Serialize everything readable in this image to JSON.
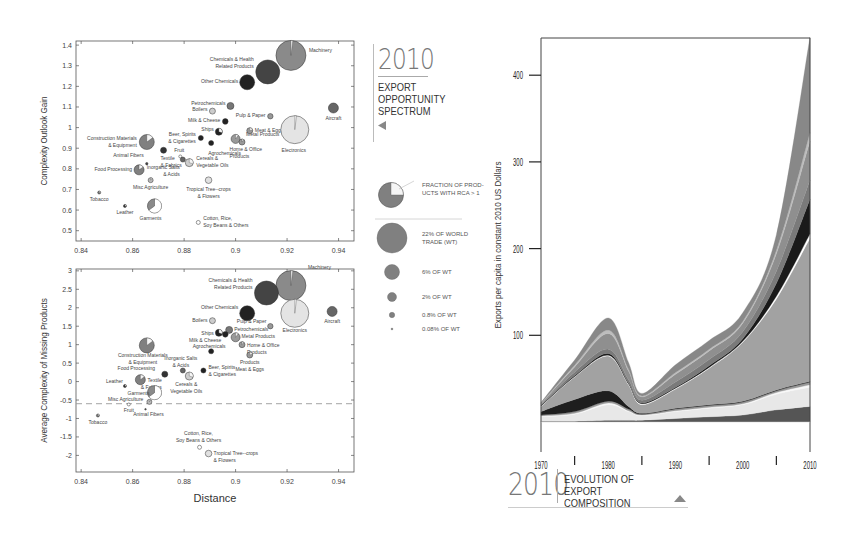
{
  "chart_data": [
    {
      "type": "scatter",
      "title": "Export Opportunity Spectrum (2010) - Complexity Outlook Gain",
      "xlabel": "",
      "ylabel": "Complexity Outlook Gain",
      "xlim": [
        0.838,
        0.946
      ],
      "ylim": [
        0.45,
        1.42
      ],
      "xticks": [
        "0.84",
        "0.86",
        "0.88",
        "0.9",
        "0.92",
        "0.94"
      ],
      "yticks": [
        "1.4",
        "1.3",
        "1.2",
        "1.1",
        "1",
        "0.9",
        "0.8",
        "0.7",
        "0.6",
        "0.5"
      ],
      "grid": false,
      "points": [
        {
          "label": "Machinery",
          "x": 0.9215,
          "y": 1.35,
          "r": 15,
          "color": "#8a8a8a",
          "rca": 0.02,
          "label_dx": 18,
          "label_dy": -3
        },
        {
          "label": "Chemicals & Health Related Products",
          "x": 0.9125,
          "y": 1.27,
          "r": 12,
          "color": "#444444",
          "rca": 0,
          "label_dx": -14,
          "label_dy": -11,
          "anchor": "end"
        },
        {
          "label": "Other Chemicals",
          "x": 0.9045,
          "y": 1.22,
          "r": 7.5,
          "color": "#222222",
          "rca": 0,
          "label_dx": -9,
          "label_dy": 1,
          "anchor": "end"
        },
        {
          "label": "Petrochemicals",
          "x": 0.898,
          "y": 1.105,
          "r": 3.5,
          "color": "#777777",
          "rca": 0,
          "label_dx": -5,
          "label_dy": -1,
          "anchor": "end"
        },
        {
          "label": "Boilers",
          "x": 0.891,
          "y": 1.08,
          "r": 3,
          "color": "#cccccc",
          "rca": 0,
          "label_dx": -5,
          "label_dy": 0,
          "anchor": "end"
        },
        {
          "label": "Milk & Cheese",
          "x": 0.896,
          "y": 1.03,
          "r": 2.8,
          "color": "#222222",
          "rca": 0,
          "label_dx": -5,
          "label_dy": 1,
          "anchor": "end"
        },
        {
          "label": "Ships",
          "x": 0.8935,
          "y": 0.98,
          "r": 3.5,
          "color": "#222222",
          "rca": 0.3,
          "label_dx": -5,
          "label_dy": -1,
          "anchor": "end"
        },
        {
          "label": "Beer, Spirits & Cigarettes",
          "x": 0.8865,
          "y": 0.95,
          "r": 2.5,
          "color": "#222222",
          "rca": 0,
          "label_dx": -5,
          "label_dy": -2,
          "anchor": "end"
        },
        {
          "label": "Agrochemicals",
          "x": 0.8905,
          "y": 0.925,
          "r": 2.5,
          "color": "#222222",
          "rca": 0,
          "label_dx": -3,
          "label_dy": 12,
          "anchor": "start"
        },
        {
          "label": "Home & Office Products",
          "x": 0.9,
          "y": 0.945,
          "r": 4.5,
          "color": "#999999",
          "rca": 0.1,
          "label_dx": -6,
          "label_dy": 12,
          "anchor": "start"
        },
        {
          "label": "Metal Products",
          "x": 0.9025,
          "y": 0.93,
          "r": 3,
          "color": "#999999",
          "rca": 0.1,
          "label_dx": 4,
          "label_dy": -6,
          "anchor": "start"
        },
        {
          "label": "Meat & Eggs",
          "x": 0.9055,
          "y": 0.985,
          "r": 3,
          "color": "#999999",
          "rca": 0.2,
          "label_dx": 5,
          "label_dy": 1,
          "anchor": "start"
        },
        {
          "label": "Pulp & Paper",
          "x": 0.9135,
          "y": 1.055,
          "r": 2.7,
          "color": "#999999",
          "rca": 0,
          "label_dx": -5,
          "label_dy": 1,
          "anchor": "end"
        },
        {
          "label": "Aircraft",
          "x": 0.938,
          "y": 1.095,
          "r": 5,
          "color": "#666666",
          "rca": 0,
          "label_dx": 0,
          "label_dy": 12,
          "anchor": "middle"
        },
        {
          "label": "Electronics",
          "x": 0.923,
          "y": 0.99,
          "r": 14,
          "color": "#e4e4e4",
          "rca": 0.02,
          "label_dx": -1,
          "label_dy": 22,
          "anchor": "middle"
        },
        {
          "label": "Construction Materials & Equipment",
          "x": 0.8655,
          "y": 0.93,
          "r": 7.5,
          "color": "#808080",
          "rca": 0.15,
          "label_dx": -10,
          "label_dy": -2,
          "anchor": "end"
        },
        {
          "label": "Textile & Fabrics",
          "x": 0.872,
          "y": 0.89,
          "r": 3,
          "color": "#333333",
          "rca": 0,
          "label_dx": -3,
          "label_dy": 10,
          "anchor": "start"
        },
        {
          "label": "Fruit",
          "x": 0.8785,
          "y": 0.86,
          "r": 1.5,
          "color": "#ffffff",
          "rca": 0,
          "label_dx": -1,
          "label_dy": -4,
          "anchor": "middle"
        },
        {
          "label": "Inorganic Salts & Acids",
          "x": 0.8795,
          "y": 0.845,
          "r": 2.5,
          "color": "#666666",
          "rca": 0,
          "label_dx": -3,
          "label_dy": 9,
          "anchor": "end"
        },
        {
          "label": "Cereals & Vegetable Oils",
          "x": 0.882,
          "y": 0.83,
          "r": 4,
          "color": "#cfcfcf",
          "rca": 0.3,
          "label_dx": 7,
          "label_dy": -3,
          "anchor": "start"
        },
        {
          "label": "Animal Fibers",
          "x": 0.8655,
          "y": 0.825,
          "r": 1.2,
          "color": "#444444",
          "rca": 0,
          "label_dx": -3,
          "label_dy": -7,
          "anchor": "end"
        },
        {
          "label": "Food Processing",
          "x": 0.8625,
          "y": 0.795,
          "r": 5,
          "color": "#808080",
          "rca": 0.15,
          "label_dx": -7,
          "label_dy": 1,
          "anchor": "end"
        },
        {
          "label": "Misc Agriculture",
          "x": 0.867,
          "y": 0.745,
          "r": 2.5,
          "color": "#bbbbbb",
          "rca": 0.1,
          "label_dx": 0,
          "label_dy": 9,
          "anchor": "middle"
        },
        {
          "label": "Tropical Tree-crops & Flowers",
          "x": 0.8895,
          "y": 0.745,
          "r": 3.3,
          "color": "#e0e0e0",
          "rca": 0,
          "label_dx": 0,
          "label_dy": 11,
          "anchor": "middle"
        },
        {
          "label": "Tobacco",
          "x": 0.847,
          "y": 0.685,
          "r": 1.5,
          "color": "#777777",
          "rca": 0.3,
          "label_dx": 0,
          "label_dy": 8,
          "anchor": "middle"
        },
        {
          "label": "Leather",
          "x": 0.857,
          "y": 0.62,
          "r": 1.5,
          "color": "#333333",
          "rca": 0.3,
          "label_dx": 0,
          "label_dy": 8,
          "anchor": "middle"
        },
        {
          "label": "Garments",
          "x": 0.8685,
          "y": 0.62,
          "r": 7,
          "color": "#ffffff",
          "rca": 0.65,
          "label_dx": -4,
          "label_dy": 14,
          "anchor": "middle"
        },
        {
          "label": "Cotton, Rice, Soy Beans & Others",
          "x": 0.8855,
          "y": 0.54,
          "r": 2,
          "color": "#ffffff",
          "rca": 0,
          "label_dx": 5,
          "label_dy": -2,
          "anchor": "start"
        }
      ]
    },
    {
      "type": "scatter",
      "title": "Export Opportunity Spectrum (2010) - Average Complexity of Missing Products",
      "xlabel": "Distance",
      "ylabel": "Average Complexity of Missing Products",
      "xlim": [
        0.838,
        0.946
      ],
      "ylim": [
        -2.45,
        3.05
      ],
      "xticks": [
        "0.84",
        "0.86",
        "0.88",
        "0.9",
        "0.92",
        "0.94"
      ],
      "yticks": [
        "3",
        "2.5",
        "2",
        "1.5",
        "1",
        "0.5",
        "0",
        "-0.5",
        "-1",
        "-1.5",
        "-2"
      ],
      "reference_line": {
        "y": -0.6,
        "style": "dashed"
      },
      "grid": false,
      "points": [
        {
          "label": "Machinery",
          "x": 0.9215,
          "y": 2.6,
          "r": 15,
          "color": "#8a8a8a",
          "rca": 0.02
        },
        {
          "label": "Chemicals & Health Related Products",
          "x": 0.912,
          "y": 2.4,
          "r": 12,
          "color": "#444444",
          "rca": 0
        },
        {
          "label": "Electronics",
          "x": 0.923,
          "y": 1.85,
          "r": 14,
          "color": "#e4e4e4",
          "rca": 0.02
        },
        {
          "label": "Other Chemicals",
          "x": 0.9045,
          "y": 1.85,
          "r": 7.5,
          "color": "#222222",
          "rca": 0
        },
        {
          "label": "Aircraft",
          "x": 0.9375,
          "y": 1.9,
          "r": 5,
          "color": "#666666",
          "rca": 0
        },
        {
          "label": "Pulp & Paper",
          "x": 0.9135,
          "y": 1.5,
          "r": 2.7,
          "color": "#999999",
          "rca": 0
        },
        {
          "label": "Boilers",
          "x": 0.891,
          "y": 1.65,
          "r": 3,
          "color": "#cccccc",
          "rca": 0
        },
        {
          "label": "Petrochemicals",
          "x": 0.8975,
          "y": 1.4,
          "r": 3.5,
          "color": "#777777",
          "rca": 0
        },
        {
          "label": "Ships",
          "x": 0.8935,
          "y": 1.32,
          "r": 3.5,
          "color": "#222222",
          "rca": 0.3
        },
        {
          "label": "Milk & Cheese",
          "x": 0.896,
          "y": 1.28,
          "r": 2.8,
          "color": "#222222",
          "rca": 0
        },
        {
          "label": "Metal Products",
          "x": 0.9,
          "y": 1.2,
          "r": 4.5,
          "color": "#999999",
          "rca": 0.1
        },
        {
          "label": "Home & Office Products",
          "x": 0.9025,
          "y": 1.0,
          "r": 3,
          "color": "#999999",
          "rca": 0.1
        },
        {
          "label": "Products Meat & Eggs",
          "x": 0.9055,
          "y": 0.72,
          "r": 3,
          "color": "#999999",
          "rca": 0.2
        },
        {
          "label": "Agrochemicals",
          "x": 0.8905,
          "y": 0.82,
          "r": 2.5,
          "color": "#222222",
          "rca": 0
        },
        {
          "label": "Construction Materials & Equipment",
          "x": 0.8655,
          "y": 0.98,
          "r": 7.5,
          "color": "#808080",
          "rca": 0.15
        },
        {
          "label": "Inorganic Salts & Acids",
          "x": 0.8795,
          "y": 0.3,
          "r": 2.5,
          "color": "#666666",
          "rca": 0
        },
        {
          "label": "Beer, Spirits & Cigarettes",
          "x": 0.8875,
          "y": 0.3,
          "r": 2.5,
          "color": "#222222",
          "rca": 0
        },
        {
          "label": "Cereals & Vegetable Oils",
          "x": 0.882,
          "y": 0.15,
          "r": 4,
          "color": "#cfcfcf",
          "rca": 0.3
        },
        {
          "label": "Textile & Fabrics",
          "x": 0.8725,
          "y": 0.2,
          "r": 3,
          "color": "#333333",
          "rca": 0
        },
        {
          "label": "Food Processing",
          "x": 0.863,
          "y": 0.05,
          "r": 5,
          "color": "#808080",
          "rca": 0.15
        },
        {
          "label": "Leather",
          "x": 0.857,
          "y": -0.12,
          "r": 1.5,
          "color": "#333333",
          "rca": 0.3
        },
        {
          "label": "Garments",
          "x": 0.8685,
          "y": -0.3,
          "r": 7,
          "color": "#ffffff",
          "rca": 0.65
        },
        {
          "label": "Misc Agriculture",
          "x": 0.8665,
          "y": -0.55,
          "r": 2.5,
          "color": "#bbbbbb",
          "rca": 0.1
        },
        {
          "label": "Animal Fibers",
          "x": 0.865,
          "y": -0.75,
          "r": 0.8,
          "color": "#444444",
          "rca": 0
        },
        {
          "label": "Fruit",
          "x": 0.8585,
          "y": -0.62,
          "r": 1.5,
          "color": "#ffffff",
          "rca": 0
        },
        {
          "label": "Tobacco",
          "x": 0.8465,
          "y": -0.92,
          "r": 1.5,
          "color": "#777777",
          "rca": 0.3
        },
        {
          "label": "Cotton, Rice, Soy Beans & Others",
          "x": 0.886,
          "y": -1.78,
          "r": 2,
          "color": "#ffffff",
          "rca": 0
        },
        {
          "label": "Tropical Tree-crops & Flowers",
          "x": 0.8895,
          "y": -1.95,
          "r": 3.3,
          "color": "#e0e0e0",
          "rca": 0
        }
      ]
    },
    {
      "type": "area",
      "stacked": true,
      "title": "Evolution of Export Composition (2010)",
      "xlabel": "Years",
      "ylabel": "Exports per capita in constant 2010 US Dollars",
      "xlim": [
        1970,
        2010
      ],
      "ylim": [
        0,
        440
      ],
      "xticks": [
        "1970",
        "1980",
        "1990",
        "2000",
        "2010"
      ],
      "yticks": [
        "400",
        "300",
        "200",
        "100"
      ],
      "x": [
        1970,
        1975,
        1980,
        1983,
        1985,
        1990,
        1995,
        2000,
        2005,
        2010
      ],
      "series": [
        {
          "name": "base-dark",
          "color": "#555555",
          "values": [
            1,
            1,
            2,
            2,
            2,
            4,
            6,
            8,
            14,
            18
          ]
        },
        {
          "name": "light-1",
          "color": "#e8e8e8",
          "values": [
            5,
            8,
            18,
            10,
            5,
            8,
            10,
            12,
            18,
            22
          ]
        },
        {
          "name": "white-line",
          "color": "#f8f8f8",
          "values": [
            1,
            1,
            2,
            1,
            1,
            1,
            1,
            1,
            2,
            3
          ]
        },
        {
          "name": "light-2",
          "color": "#9a9a9a",
          "values": [
            1,
            2,
            2,
            2,
            1,
            2,
            2,
            2,
            2,
            3
          ]
        },
        {
          "name": "black",
          "color": "#1e1e1e",
          "values": [
            4,
            14,
            12,
            3,
            1,
            1,
            1,
            1,
            1,
            1
          ]
        },
        {
          "name": "main-grey",
          "color": "#a2a2a2",
          "values": [
            6,
            26,
            40,
            25,
            10,
            22,
            42,
            68,
            105,
            165
          ]
        },
        {
          "name": "white-sep",
          "color": "#ffffff",
          "values": [
            0.5,
            0.5,
            1,
            1,
            1,
            1,
            1,
            1,
            3,
            5
          ]
        },
        {
          "name": "dark-stripe",
          "color": "#1a1a1a",
          "values": [
            0.5,
            1,
            2,
            1,
            1,
            1,
            2,
            3,
            15,
            40
          ]
        },
        {
          "name": "mid-grey-1",
          "color": "#7a7a7a",
          "values": [
            1,
            4,
            5,
            4,
            3,
            6,
            7,
            8,
            14,
            22
          ]
        },
        {
          "name": "mid-grey-2",
          "color": "#8f8f8f",
          "values": [
            1,
            6,
            18,
            10,
            4,
            9,
            10,
            10,
            20,
            45
          ]
        },
        {
          "name": "light-grey-3",
          "color": "#bdbdbd",
          "values": [
            0.5,
            2,
            4,
            2,
            1,
            2,
            2,
            2,
            4,
            10
          ]
        },
        {
          "name": "top-grey",
          "color": "#888888",
          "values": [
            1,
            6,
            14,
            8,
            3,
            9,
            10,
            10,
            18,
            110
          ]
        }
      ]
    }
  ],
  "legend": {
    "pie_label_line1": "FRACTION OF PROD-",
    "pie_label_line2": "UCTS WITH RCA > 1",
    "sizes": [
      {
        "label_line1": "22% OF WORLD",
        "label_line2": "TRADE (WT)",
        "r": 15
      },
      {
        "label_line1": "6% OF WT",
        "label_line2": "",
        "r": 7.5
      },
      {
        "label_line1": "2% OF WT",
        "label_line2": "",
        "r": 4.5
      },
      {
        "label_line1": "0.8% OF WT",
        "label_line2": "",
        "r": 2.7
      },
      {
        "label_line1": "0.08% OF WT",
        "label_line2": "",
        "r": 0.9
      }
    ],
    "bubble_color": "#808080"
  },
  "panel_left_title": {
    "year": "2010",
    "line1": "EXPORT",
    "line2": "OPPORTUNITY",
    "line3": "SPECTRUM",
    "arrow": "triangle-left-icon"
  },
  "panel_right_title": {
    "year": "2010",
    "line1": "EVOLUTION OF",
    "line2": "EXPORT COMPOSITION",
    "arrow": "triangle-up-icon"
  },
  "colors": {
    "axis": "#333333",
    "ink": "#333333",
    "accent_grey": "#777777"
  }
}
